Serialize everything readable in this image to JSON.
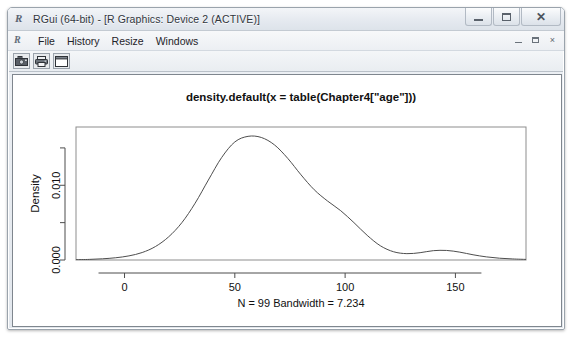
{
  "window": {
    "title": "RGui (64-bit) - [R Graphics: Device 2 (ACTIVE)]",
    "app_icon": "R",
    "controls": {
      "minimize": "minimize",
      "maximize": "maximize",
      "close": "close"
    }
  },
  "menubar": {
    "child_icon": "R",
    "items": [
      {
        "label": "File"
      },
      {
        "label": "History"
      },
      {
        "label": "Resize"
      },
      {
        "label": "Windows"
      }
    ],
    "mdi_controls": {
      "minimize": "_",
      "restore": "restore",
      "close": "×"
    }
  },
  "toolbar": {
    "buttons": [
      {
        "name": "copy-to-clipboard",
        "icon": "camera-icon"
      },
      {
        "name": "print",
        "icon": "printer-icon"
      },
      {
        "name": "blank-window",
        "icon": "window-icon"
      }
    ]
  },
  "chart_data": {
    "type": "line",
    "title": "density.default(x = table(Chapter4[\"age\"]))",
    "subtitle": "N = 99   Bandwidth = 7.234",
    "xlabel": "",
    "ylabel": "Density",
    "grid": false,
    "legend": "none",
    "xlim": [
      -22,
      182
    ],
    "ylim": [
      0,
      0.0178
    ],
    "xticks": [
      0,
      50,
      100,
      150
    ],
    "xtick_labels": [
      "0",
      "50",
      "100",
      "150"
    ],
    "yticks": [
      0.0,
      0.005,
      0.01,
      0.015
    ],
    "ytick_labels": [
      "0.000",
      "",
      "0.010",
      ""
    ],
    "series": [
      {
        "name": "density",
        "color": "#4d4d4d",
        "x": [
          -22,
          -16,
          -10,
          -4,
          2,
          8,
          14,
          20,
          26,
          32,
          38,
          44,
          50,
          56,
          62,
          68,
          74,
          80,
          86,
          92,
          98,
          104,
          110,
          116,
          122,
          128,
          134,
          140,
          146,
          152,
          158,
          164,
          170,
          176,
          182
        ],
        "y": [
          4e-05,
          8e-05,
          0.00016,
          0.0003,
          0.00055,
          0.001,
          0.0018,
          0.0031,
          0.005,
          0.0076,
          0.0107,
          0.0137,
          0.0158,
          0.01655,
          0.0164,
          0.0154,
          0.0136,
          0.0114,
          0.0094,
          0.0079,
          0.0066,
          0.005,
          0.0033,
          0.0019,
          0.0011,
          0.00085,
          0.00098,
          0.00125,
          0.00128,
          0.00105,
          0.0007,
          0.00042,
          0.00024,
          0.00014,
          8e-05
        ]
      }
    ]
  }
}
